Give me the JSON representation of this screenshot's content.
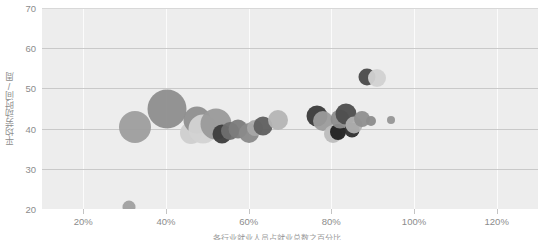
{
  "chart_data": {
    "type": "scatter",
    "title": "",
    "xlabel": "各行业就业人员占就业总数之百分比",
    "ylabel": "平均劳动时间/周",
    "xlim": [
      10,
      130
    ],
    "ylim": [
      20,
      70
    ],
    "xticks": [
      "20%",
      "40%",
      "60%",
      "80%",
      "100%",
      "120%"
    ],
    "xtick_values": [
      20,
      40,
      60,
      80,
      100,
      120
    ],
    "yticks": [
      "20",
      "30",
      "40",
      "50",
      "60",
      "70"
    ],
    "ytick_values": [
      20,
      30,
      40,
      50,
      60,
      70
    ],
    "grid": true,
    "legend": "none",
    "bubble_color_scale": "greyscale",
    "points": [
      {
        "x": 31.0,
        "y": 20.4,
        "r": 6.5,
        "color": "#a0a0a0",
        "opacity": 0.95
      },
      {
        "x": 32.5,
        "y": 40.5,
        "r": 16.0,
        "color": "#9e9e9e",
        "opacity": 0.95
      },
      {
        "x": 40.2,
        "y": 44.8,
        "r": 19.5,
        "color": "#8e8e8e",
        "opacity": 0.95
      },
      {
        "x": 46.0,
        "y": 39.0,
        "r": 11.0,
        "color": "#cfcfcf",
        "opacity": 0.95
      },
      {
        "x": 47.5,
        "y": 42.2,
        "r": 13.5,
        "color": "#8f8f8f",
        "opacity": 0.95
      },
      {
        "x": 49.0,
        "y": 40.0,
        "r": 14.5,
        "color": "#d3d3d3",
        "opacity": 0.95
      },
      {
        "x": 52.0,
        "y": 41.2,
        "r": 15.5,
        "color": "#9a9a9a",
        "opacity": 0.95
      },
      {
        "x": 53.5,
        "y": 38.6,
        "r": 9.5,
        "color": "#3c3c3c",
        "opacity": 0.95
      },
      {
        "x": 55.5,
        "y": 39.4,
        "r": 9.0,
        "color": "#6f6f6f",
        "opacity": 0.95
      },
      {
        "x": 57.5,
        "y": 39.8,
        "r": 9.5,
        "color": "#7c7c7c",
        "opacity": 0.95
      },
      {
        "x": 60.0,
        "y": 38.8,
        "r": 10.0,
        "color": "#8a8a8a",
        "opacity": 0.95
      },
      {
        "x": 61.5,
        "y": 40.2,
        "r": 8.0,
        "color": "#a8a8a8",
        "opacity": 0.95
      },
      {
        "x": 63.5,
        "y": 40.6,
        "r": 9.5,
        "color": "#5f5f5f",
        "opacity": 0.95
      },
      {
        "x": 67.0,
        "y": 42.2,
        "r": 10.0,
        "color": "#b5b5b5",
        "opacity": 0.95
      },
      {
        "x": 76.5,
        "y": 43.2,
        "r": 10.5,
        "color": "#3a3a3a",
        "opacity": 0.95
      },
      {
        "x": 78.0,
        "y": 42.0,
        "r": 10.0,
        "color": "#9c9c9c",
        "opacity": 0.95
      },
      {
        "x": 80.5,
        "y": 38.6,
        "r": 9.0,
        "color": "#bdbdbd",
        "opacity": 0.95
      },
      {
        "x": 81.5,
        "y": 39.2,
        "r": 8.0,
        "color": "#202020",
        "opacity": 0.95
      },
      {
        "x": 82.0,
        "y": 42.4,
        "r": 9.5,
        "color": "#8d8d8d",
        "opacity": 0.95
      },
      {
        "x": 83.5,
        "y": 43.6,
        "r": 10.5,
        "color": "#4d4d4d",
        "opacity": 0.95
      },
      {
        "x": 85.0,
        "y": 39.6,
        "r": 7.5,
        "color": "#2e2e2e",
        "opacity": 0.95
      },
      {
        "x": 85.5,
        "y": 41.0,
        "r": 8.5,
        "color": "#b0b0b0",
        "opacity": 0.95
      },
      {
        "x": 87.5,
        "y": 42.4,
        "r": 8.0,
        "color": "#8f8f8f",
        "opacity": 0.95
      },
      {
        "x": 89.5,
        "y": 42.0,
        "r": 5.0,
        "color": "#8c8c8c",
        "opacity": 0.95
      },
      {
        "x": 94.5,
        "y": 42.2,
        "r": 4.0,
        "color": "#969696",
        "opacity": 0.95
      },
      {
        "x": 88.5,
        "y": 52.8,
        "r": 8.5,
        "color": "#4a4a4a",
        "opacity": 0.95
      },
      {
        "x": 91.0,
        "y": 52.6,
        "r": 9.0,
        "color": "#d2d2d2",
        "opacity": 0.95
      }
    ]
  },
  "axes": {
    "plot_bg": "#ededed",
    "gridline_v_color": "#fbfbfb",
    "gridline_h_color": "#c9c9c9",
    "tick_text_color": "#8c8c8c"
  }
}
